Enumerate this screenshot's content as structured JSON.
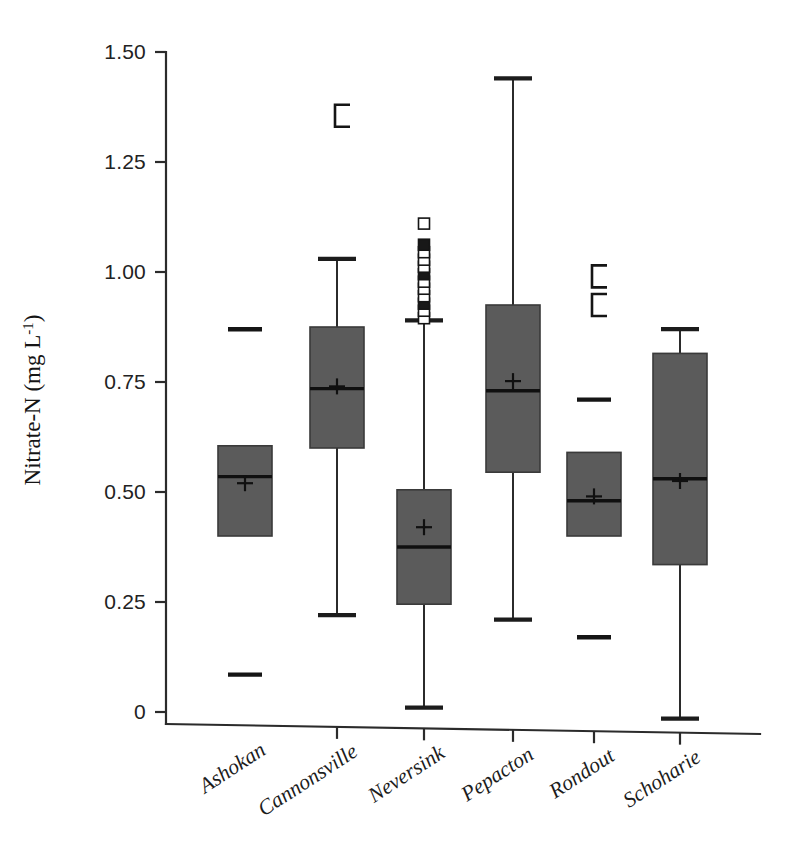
{
  "figure": {
    "background": "#ffffff",
    "box_fill": "#5b5b5b",
    "line_color": "#1c1c1c"
  },
  "chart_data": {
    "type": "box",
    "title": "",
    "xlabel": "",
    "ylabel": "Nitrate-N (mg L⁻¹)",
    "ylabel_main": "Nitrate-N (mg L",
    "ylabel_sup": "-1",
    "ylabel_close": ")",
    "ylim": [
      -0.05,
      1.52
    ],
    "yticks": [
      0,
      0.25,
      0.5,
      0.75,
      1.0,
      1.25,
      1.5
    ],
    "ytick_labels": [
      "0",
      "0.25",
      "0.50",
      "0.75",
      "1.00",
      "1.25",
      "1.50"
    ],
    "grid": false,
    "legend": "none",
    "categories": [
      "Ashokan",
      "Cannonsville",
      "Neversink",
      "Pepacton",
      "Rondout",
      "Schoharie"
    ],
    "boxes": [
      {
        "name": "Ashokan",
        "q1": 0.4,
        "q3": 0.605,
        "median": 0.535,
        "mean": 0.52,
        "whisker_low": null,
        "whisker_high": null,
        "outliers_dash": [
          0.87,
          0.085
        ],
        "outliers_bracket": [],
        "outliers_square": []
      },
      {
        "name": "Cannonsville",
        "q1": 0.6,
        "q3": 0.875,
        "median": 0.735,
        "mean": 0.74,
        "whisker_low": 0.22,
        "whisker_high": 1.03,
        "outliers_dash": [],
        "outliers_bracket": [
          1.355
        ],
        "outliers_square": []
      },
      {
        "name": "Neversink",
        "q1": 0.245,
        "q3": 0.505,
        "median": 0.375,
        "mean": 0.42,
        "whisker_low": 0.01,
        "whisker_high": 0.89,
        "outliers_dash": [],
        "outliers_bracket": [],
        "outliers_square": [
          0.895,
          0.912,
          0.928,
          0.945,
          0.962,
          0.978,
          0.995,
          1.012,
          1.028,
          1.045,
          1.062,
          1.11
        ]
      },
      {
        "name": "Pepacton",
        "q1": 0.545,
        "q3": 0.925,
        "median": 0.73,
        "mean": 0.752,
        "whisker_low": 0.21,
        "whisker_high": 1.44,
        "outliers_dash": [],
        "outliers_bracket": [],
        "outliers_square": []
      },
      {
        "name": "Rondout",
        "q1": 0.4,
        "q3": 0.59,
        "median": 0.48,
        "mean": 0.49,
        "whisker_low": null,
        "whisker_high": null,
        "outliers_dash": [
          0.71,
          0.17
        ],
        "outliers_bracket": [
          0.99,
          0.925
        ],
        "outliers_square": []
      },
      {
        "name": "Schoharie",
        "q1": 0.335,
        "q3": 0.815,
        "median": 0.53,
        "mean": 0.525,
        "whisker_low": -0.015,
        "whisker_high": 0.87,
        "outliers_dash": [],
        "outliers_bracket": [],
        "outliers_square": []
      }
    ]
  }
}
